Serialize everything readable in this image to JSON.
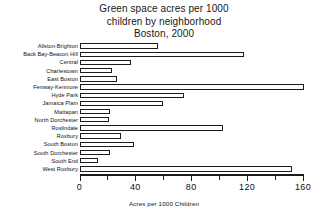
{
  "chart_data": {
    "type": "bar",
    "orientation": "horizontal",
    "title": "Green space acres per 1000 children by neighborhood Boston, 2000",
    "title_lines": [
      "Green space acres per 1000",
      "children by neighborhood",
      "Boston, 2000"
    ],
    "xlabel": "Acres per 1000 Children",
    "ylabel": "",
    "xlim": [
      0,
      160
    ],
    "grid": false,
    "legend": false,
    "xticks": [
      0,
      40,
      80,
      120,
      160
    ],
    "xtick_labels": [
      "0",
      "40",
      "80",
      "120",
      "160"
    ],
    "minor_xticks": [
      20,
      60,
      100,
      140
    ],
    "bar_style": {
      "fill": "#ffffff",
      "edge": "#1c1c1c",
      "background": "#ffffff"
    },
    "categories": [
      "Allston-Brighton",
      "Back Bay-Beacon Hill",
      "Central",
      "Charlestown",
      "East Boston",
      "Fenway-Kenmore",
      "Hyde Park",
      "Jamaica Plain",
      "Mattapan",
      "North Dorchester",
      "Roslindale",
      "Roxbury",
      "South Boston",
      "South Dorchester",
      "South End",
      "West Roxbury"
    ],
    "values": [
      56,
      118,
      37,
      23,
      27,
      161,
      75,
      60,
      22,
      21,
      103,
      30,
      39,
      22,
      13,
      152
    ]
  }
}
